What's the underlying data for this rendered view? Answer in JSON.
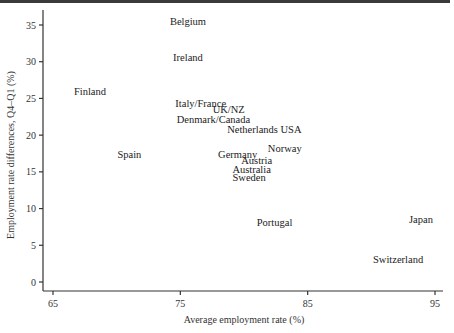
{
  "chart_data": {
    "type": "scatter",
    "title": "",
    "xlabel": "Average employment rate (%)",
    "ylabel": "Employment rate differences, Q4–Q1 (%)",
    "xlim": [
      64.2,
      95.6
    ],
    "ylim": [
      -1.2,
      36.5
    ],
    "xticks": [
      65,
      75,
      85,
      95
    ],
    "yticks": [
      0,
      5,
      10,
      15,
      20,
      25,
      30,
      35
    ],
    "grid": false,
    "legend": "none",
    "points": [
      {
        "label": "Belgium",
        "x": 75.6,
        "y": 35.5
      },
      {
        "label": "Ireland",
        "x": 75.6,
        "y": 30.6
      },
      {
        "label": "Finland",
        "x": 67.9,
        "y": 25.9
      },
      {
        "label": "Italy/France",
        "x": 76.6,
        "y": 24.3
      },
      {
        "label": "UK/NZ",
        "x": 78.8,
        "y": 23.5
      },
      {
        "label": "Denmark/Canada",
        "x": 77.6,
        "y": 22.1
      },
      {
        "label": "Netherlands USA",
        "x": 81.6,
        "y": 20.8
      },
      {
        "label": "Norway",
        "x": 83.2,
        "y": 18.2
      },
      {
        "label": "Spain",
        "x": 71.0,
        "y": 17.4
      },
      {
        "label": "Germany",
        "x": 79.5,
        "y": 17.3
      },
      {
        "label": "Austria",
        "x": 81.0,
        "y": 16.6
      },
      {
        "label": "Australia",
        "x": 80.6,
        "y": 15.3
      },
      {
        "label": "Sweden",
        "x": 80.4,
        "y": 14.2
      },
      {
        "label": "Japan",
        "x": 93.9,
        "y": 8.5
      },
      {
        "label": "Portugal",
        "x": 82.4,
        "y": 8.1
      },
      {
        "label": "Switzerland",
        "x": 92.1,
        "y": 3.0
      }
    ]
  }
}
